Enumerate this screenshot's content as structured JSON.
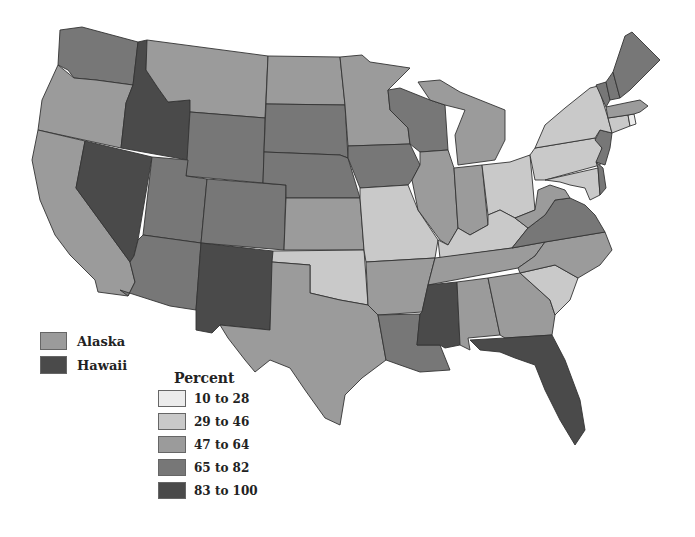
{
  "chart_data": {
    "type": "choropleth",
    "title": "",
    "legend_title": "Percent",
    "bins": [
      {
        "label": "10 to 28",
        "min": 10,
        "max": 28,
        "color": "#ececec"
      },
      {
        "label": "29 to 46",
        "min": 29,
        "max": 46,
        "color": "#c9c9c9"
      },
      {
        "label": "47 to 64",
        "min": 47,
        "max": 64,
        "color": "#9b9b9b"
      },
      {
        "label": "65 to 82",
        "min": 65,
        "max": 82,
        "color": "#777777"
      },
      {
        "label": "83 to 100",
        "min": 83,
        "max": 100,
        "color": "#4a4a4a"
      }
    ],
    "states": {
      "WA": "65 to 82",
      "OR": "47 to 64",
      "CA": "47 to 64",
      "ID": "83 to 100",
      "NV": "83 to 100",
      "MT": "47 to 64",
      "WY": "65 to 82",
      "UT": "65 to 82",
      "CO": "65 to 82",
      "AZ": "65 to 82",
      "NM": "83 to 100",
      "ND": "47 to 64",
      "SD": "65 to 82",
      "NE": "65 to 82",
      "KS": "47 to 64",
      "OK": "29 to 46",
      "TX": "47 to 64",
      "MN": "47 to 64",
      "IA": "65 to 82",
      "MO": "29 to 46",
      "AR": "47 to 64",
      "LA": "65 to 82",
      "WI": "65 to 82",
      "IL": "47 to 64",
      "MI": "47 to 64",
      "IN": "47 to 64",
      "OH": "29 to 46",
      "KY": "29 to 46",
      "TN": "47 to 64",
      "MS": "83 to 100",
      "AL": "47 to 64",
      "GA": "47 to 64",
      "FL": "83 to 100",
      "SC": "29 to 46",
      "NC": "47 to 64",
      "VA": "65 to 82",
      "WV": "47 to 64",
      "MD": "29 to 46",
      "DE": "65 to 82",
      "PA": "29 to 46",
      "NJ": "65 to 82",
      "NY": "29 to 46",
      "CT": "29 to 46",
      "RI": "10 to 28",
      "MA": "47 to 64",
      "VT": "65 to 82",
      "NH": "65 to 82",
      "ME": "65 to 82",
      "AK": "47 to 64",
      "HI": "83 to 100"
    },
    "insets": [
      {
        "label": "Alaska",
        "bin": "47 to 64"
      },
      {
        "label": "Hawaii",
        "bin": "83 to 100"
      }
    ]
  },
  "legend": {
    "title": "Percent",
    "items": [
      "10 to 28",
      "29 to 46",
      "47 to 64",
      "65 to 82",
      "83 to 100"
    ],
    "insets": [
      "Alaska",
      "Hawaii"
    ]
  }
}
